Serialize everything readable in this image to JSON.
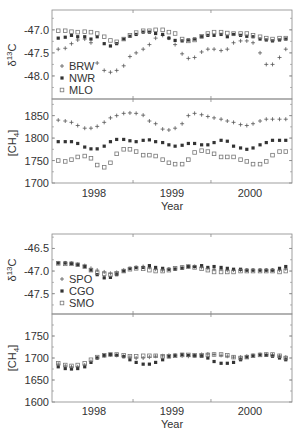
{
  "figure": {
    "xlabel": "Year",
    "x_tick_labels": [
      "1998",
      "1999",
      "2000"
    ]
  },
  "chart_data": [
    {
      "type": "scatter",
      "panel": "top-d13C",
      "ylabel": "δ13C",
      "ylim": [
        -48.5,
        -46.8
      ],
      "yticks": [
        -47.0,
        -47.5,
        -48.0
      ],
      "ytick_labels": [
        "-47.0",
        "-47.5",
        "-48.0"
      ],
      "xlim": [
        1997.5,
        2000.55
      ],
      "legend": [
        "BRW",
        "NWR",
        "MLO"
      ],
      "legend_position": "lower-left",
      "x": [
        1997.54,
        1997.63,
        1997.71,
        1997.79,
        1997.88,
        1997.96,
        1998.04,
        1998.13,
        1998.21,
        1998.29,
        1998.38,
        1998.46,
        1998.54,
        1998.63,
        1998.71,
        1998.79,
        1998.88,
        1998.96,
        1999.04,
        1999.13,
        1999.21,
        1999.29,
        1999.38,
        1999.46,
        1999.54,
        1999.63,
        1999.71,
        1999.79,
        1999.88,
        1999.96,
        2000.04,
        2000.13,
        2000.21,
        2000.29,
        2000.38,
        2000.46
      ],
      "series": [
        {
          "name": "BRW",
          "marker": "plus",
          "values": [
            -47.42,
            -47.4,
            -47.3,
            -47.22,
            -47.2,
            -47.28,
            -47.72,
            -47.88,
            -47.92,
            -47.88,
            -47.78,
            -47.58,
            -47.5,
            -47.42,
            -47.32,
            -47.18,
            -47.12,
            -47.18,
            -47.32,
            -47.52,
            -47.62,
            -47.6,
            -47.48,
            -47.42,
            -47.42,
            -47.45,
            -47.42,
            -47.28,
            -47.24,
            -47.24,
            -47.28,
            -47.5,
            -47.75,
            -47.75,
            -47.6,
            -47.42
          ]
        },
        {
          "name": "NWR",
          "marker": "asterisk",
          "values": [
            -47.18,
            -47.16,
            -47.12,
            -47.15,
            -47.15,
            -47.2,
            -47.15,
            -47.3,
            -47.35,
            -47.3,
            -47.2,
            -47.14,
            -47.1,
            -47.05,
            -47.05,
            -47.08,
            -47.1,
            -47.18,
            -47.23,
            -47.24,
            -47.22,
            -47.2,
            -47.15,
            -47.12,
            -47.12,
            -47.1,
            -47.15,
            -47.1,
            -47.12,
            -47.14,
            -47.15,
            -47.2,
            -47.22,
            -47.24,
            -47.22,
            -47.2
          ]
        },
        {
          "name": "MLO",
          "marker": "square",
          "values": [
            -47.02,
            -47.02,
            -47.04,
            -47.05,
            -47.04,
            -47.05,
            -47.08,
            -47.15,
            -47.23,
            -47.26,
            -47.2,
            -47.12,
            -47.06,
            -47.02,
            -47.02,
            -47.0,
            -47.0,
            -47.05,
            -47.08,
            -47.2,
            -47.24,
            -47.22,
            -47.14,
            -47.08,
            -47.05,
            -47.05,
            -47.07,
            -47.08,
            -47.08,
            -47.08,
            -47.12,
            -47.15,
            -47.18,
            -47.2,
            -47.18,
            -47.18
          ]
        }
      ]
    },
    {
      "type": "scatter",
      "panel": "top-CH4",
      "ylabel": "[CH4]",
      "ylim": [
        1700,
        1885
      ],
      "yticks": [
        1850,
        1800,
        1750,
        1700
      ],
      "ytick_labels": [
        "1850",
        "1800",
        "1750",
        "1700"
      ],
      "xlim": [
        1997.5,
        2000.55
      ],
      "series": [
        {
          "name": "BRW",
          "marker": "plus",
          "values": [
            1840,
            1838,
            1835,
            1828,
            1822,
            1822,
            1826,
            1835,
            1845,
            1850,
            1855,
            1856,
            1855,
            1851,
            1838,
            1832,
            1820,
            1818,
            1822,
            1832,
            1850,
            1855,
            1852,
            1848,
            1845,
            1842,
            1838,
            1835,
            1830,
            1828,
            1832,
            1838,
            1842,
            1842,
            1842,
            1842
          ]
        },
        {
          "name": "NWR",
          "marker": "asterisk",
          "values": [
            1792,
            1792,
            1792,
            1788,
            1780,
            1776,
            1776,
            1782,
            1792,
            1797,
            1797,
            1794,
            1792,
            1795,
            1796,
            1792,
            1790,
            1785,
            1782,
            1784,
            1788,
            1788,
            1785,
            1785,
            1790,
            1795,
            1793,
            1782,
            1778,
            1775,
            1778,
            1785,
            1790,
            1795,
            1795,
            1795
          ]
        },
        {
          "name": "MLO",
          "marker": "square",
          "values": [
            1750,
            1748,
            1752,
            1758,
            1760,
            1755,
            1740,
            1735,
            1745,
            1765,
            1775,
            1775,
            1770,
            1762,
            1762,
            1760,
            1752,
            1745,
            1742,
            1742,
            1752,
            1768,
            1772,
            1770,
            1765,
            1758,
            1758,
            1758,
            1752,
            1748,
            1742,
            1742,
            1748,
            1762,
            1770,
            1770
          ]
        }
      ]
    },
    {
      "type": "scatter",
      "panel": "bottom-d13C",
      "ylabel": "δ13C",
      "ylim": [
        -47.95,
        -46.2
      ],
      "yticks": [
        -46.5,
        -47.0,
        -47.5
      ],
      "ytick_labels": [
        "-46.5",
        "-47.0",
        "-47.5"
      ],
      "xlim": [
        1997.5,
        2000.55
      ],
      "legend": [
        "SPO",
        "CGO",
        "SMO"
      ],
      "legend_position": "lower-left",
      "x": [
        1997.54,
        1997.63,
        1997.71,
        1997.79,
        1997.88,
        1997.96,
        1998.04,
        1998.13,
        1998.21,
        1998.29,
        1998.38,
        1998.46,
        1998.54,
        1998.63,
        1998.71,
        1998.79,
        1998.88,
        1998.96,
        1999.04,
        1999.13,
        1999.21,
        1999.29,
        1999.38,
        1999.46,
        1999.54,
        1999.63,
        1999.71,
        1999.79,
        1999.88,
        1999.96,
        2000.04,
        2000.13,
        2000.21,
        2000.29,
        2000.38,
        2000.46
      ],
      "series": [
        {
          "name": "SPO",
          "marker": "plus",
          "values": [
            -46.82,
            -46.82,
            -46.83,
            -46.85,
            -46.88,
            -46.94,
            -46.98,
            -47.02,
            -47.05,
            -47.03,
            -46.98,
            -46.95,
            -46.92,
            -46.9,
            -46.92,
            -46.96,
            -46.98,
            -46.96,
            -46.94,
            -46.92,
            -46.9,
            -46.9,
            -46.92,
            -46.94,
            -46.96,
            -46.96,
            -46.98,
            -46.98,
            -46.98,
            -46.98,
            -46.98,
            -46.98,
            -46.98,
            -46.98,
            -46.98,
            -46.95
          ]
        },
        {
          "name": "CGO",
          "marker": "asterisk",
          "values": [
            -46.82,
            -46.82,
            -46.83,
            -46.86,
            -46.9,
            -46.98,
            -47.08,
            -47.15,
            -47.14,
            -47.08,
            -47.0,
            -46.94,
            -46.92,
            -46.92,
            -46.88,
            -46.92,
            -46.94,
            -46.96,
            -46.96,
            -46.94,
            -46.9,
            -46.9,
            -46.88,
            -46.92,
            -46.9,
            -46.92,
            -46.94,
            -46.96,
            -46.96,
            -46.98,
            -46.98,
            -46.98,
            -46.98,
            -46.98,
            -46.94,
            -46.9
          ]
        },
        {
          "name": "SMO",
          "marker": "square",
          "values": [
            -46.83,
            -46.84,
            -46.84,
            -46.86,
            -46.9,
            -46.98,
            -47.04,
            -47.06,
            -47.08,
            -47.05,
            -47.0,
            -46.96,
            -46.94,
            -46.95,
            -46.98,
            -47.0,
            -47.0,
            -46.98,
            -46.94,
            -46.92,
            -46.9,
            -46.92,
            -46.95,
            -46.98,
            -47.02,
            -47.02,
            -47.02,
            -47.02,
            -47.0,
            -47.0,
            -47.0,
            -47.0,
            -47.0,
            -47.0,
            -47.02,
            -47.0
          ]
        }
      ]
    },
    {
      "type": "scatter",
      "panel": "bottom-CH4",
      "ylabel": "[CH4]",
      "ylim": [
        1600,
        1800
      ],
      "yticks": [
        1750,
        1700,
        1650,
        1600
      ],
      "ytick_labels": [
        "1750",
        "1700",
        "1650",
        "1600"
      ],
      "xlim": [
        1997.5,
        2000.55
      ],
      "series": [
        {
          "name": "SPO",
          "marker": "plus",
          "values": [
            1686,
            1682,
            1680,
            1680,
            1684,
            1692,
            1700,
            1705,
            1707,
            1706,
            1704,
            1702,
            1700,
            1700,
            1702,
            1704,
            1705,
            1706,
            1706,
            1705,
            1704,
            1706,
            1708,
            1709,
            1708,
            1706,
            1704,
            1702,
            1702,
            1704,
            1706,
            1708,
            1708,
            1707,
            1705,
            1702
          ]
        },
        {
          "name": "CGO",
          "marker": "asterisk",
          "values": [
            1680,
            1676,
            1675,
            1676,
            1680,
            1690,
            1700,
            1706,
            1708,
            1706,
            1703,
            1696,
            1690,
            1686,
            1686,
            1690,
            1696,
            1703,
            1706,
            1708,
            1706,
            1705,
            1704,
            1700,
            1692,
            1688,
            1688,
            1690,
            1696,
            1702,
            1705,
            1707,
            1706,
            1704,
            1700,
            1696
          ]
        },
        {
          "name": "SMO",
          "marker": "square",
          "values": [
            1688,
            1684,
            1682,
            1684,
            1688,
            1696,
            1702,
            1706,
            1708,
            1708,
            1706,
            1704,
            1704,
            1705,
            1705,
            1705,
            1704,
            1704,
            1705,
            1707,
            1707,
            1706,
            1706,
            1707,
            1708,
            1708,
            1706,
            1702,
            1700,
            1702,
            1705,
            1707,
            1708,
            1708,
            1705,
            1700
          ]
        }
      ]
    }
  ],
  "colors": {
    "axis": "#888888",
    "text": "#333333",
    "marker": "#555555"
  }
}
